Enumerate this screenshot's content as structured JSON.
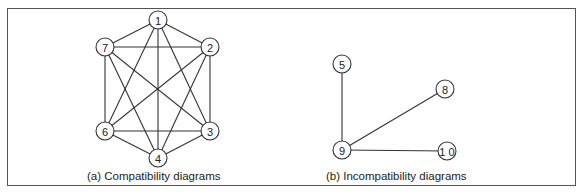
{
  "figure": {
    "panels": [
      {
        "id": "a",
        "caption": "(a) Compatibility diagrams",
        "nodes": [
          {
            "id": "1",
            "label": "1",
            "x": 158,
            "y": 20
          },
          {
            "id": "2",
            "label": "2",
            "x": 210,
            "y": 47
          },
          {
            "id": "3",
            "label": "3",
            "x": 210,
            "y": 131
          },
          {
            "id": "4",
            "label": "4",
            "x": 158,
            "y": 158
          },
          {
            "id": "6",
            "label": "6",
            "x": 105,
            "y": 131
          },
          {
            "id": "7",
            "label": "7",
            "x": 105,
            "y": 47
          }
        ],
        "edges": [
          [
            "1",
            "7"
          ],
          [
            "1",
            "2"
          ],
          [
            "1",
            "6"
          ],
          [
            "1",
            "4"
          ],
          [
            "1",
            "3"
          ],
          [
            "7",
            "2"
          ],
          [
            "7",
            "6"
          ],
          [
            "7",
            "4"
          ],
          [
            "7",
            "3"
          ],
          [
            "2",
            "6"
          ],
          [
            "2",
            "4"
          ],
          [
            "2",
            "3"
          ],
          [
            "6",
            "3"
          ],
          [
            "6",
            "4"
          ],
          [
            "3",
            "4"
          ]
        ]
      },
      {
        "id": "b",
        "caption": "(b) Incompatibility diagrams",
        "nodes": [
          {
            "id": "5",
            "label": "5",
            "x": 342,
            "y": 64
          },
          {
            "id": "8",
            "label": "8",
            "x": 445,
            "y": 89
          },
          {
            "id": "9",
            "label": "9",
            "x": 342,
            "y": 150
          },
          {
            "id": "10",
            "label": "1 0",
            "x": 447,
            "y": 151
          }
        ],
        "edges": [
          [
            "5",
            "9"
          ],
          [
            "9",
            "8"
          ],
          [
            "9",
            "10"
          ]
        ]
      }
    ],
    "style": {
      "line_color": "#333333",
      "border_color": "#555555",
      "node_radius": 9
    }
  }
}
